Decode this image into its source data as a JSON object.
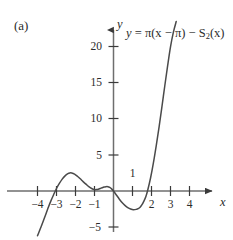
{
  "figure": {
    "panel_label": "(a)",
    "equation_prefix": "y",
    "equation_eq": "=",
    "equation_body": "π(x − π) − S",
    "equation_sub": "2",
    "equation_tail": "(x)",
    "equation_full": "y = π(x − π) − S₂(x)",
    "ink_color": "#3a3a3a",
    "curve_color": "#4a4a4a",
    "background": "#ffffff"
  },
  "chart_data": {
    "type": "line",
    "panel": "(a)",
    "xlabel": "x",
    "ylabel": "y",
    "xlim": [
      -4.8,
      4.8
    ],
    "ylim": [
      -6.5,
      22.5
    ],
    "xticks": [
      -4,
      -3,
      -2,
      -1,
      1,
      2,
      3,
      4
    ],
    "xtick_labels": [
      "−4",
      "−3",
      "−2",
      "−1",
      "1",
      "2",
      "3",
      "4"
    ],
    "xtick_label_above_axis": [
      false,
      false,
      false,
      false,
      true,
      false,
      false,
      false
    ],
    "yticks": [
      -5,
      5,
      10,
      15,
      20
    ],
    "ytick_labels": [
      "−5",
      "5",
      "10",
      "15",
      "20"
    ],
    "grid": false,
    "legend": false,
    "axis_style": "arrows",
    "series": [
      {
        "name": "y = π(x − π) − S₂(x)",
        "x": [
          -4.0,
          -3.8,
          -3.6,
          -3.45,
          -3.3,
          -3.15,
          -3.0,
          -2.85,
          -2.7,
          -2.55,
          -2.4,
          -2.3,
          -2.2,
          -2.05,
          -1.9,
          -1.75,
          -1.6,
          -1.45,
          -1.3,
          -1.15,
          -1.0,
          -0.9,
          -0.8,
          -0.7,
          -0.6,
          -0.5,
          -0.4,
          -0.3,
          -0.2,
          -0.1,
          0.0,
          0.15,
          0.3,
          0.45,
          0.6,
          0.75,
          0.9,
          1.05,
          1.2,
          1.3,
          1.4,
          1.5,
          1.6,
          1.7,
          1.8,
          1.95,
          2.1,
          2.25,
          2.4,
          2.55,
          2.7,
          2.85,
          3.0,
          3.15,
          3.3
        ],
        "y": [
          -6.2,
          -4.9,
          -3.5,
          -2.4,
          -1.4,
          -0.5,
          0.35,
          1.05,
          1.65,
          2.1,
          2.4,
          2.5,
          2.5,
          2.35,
          2.05,
          1.7,
          1.3,
          0.95,
          0.6,
          0.35,
          0.2,
          0.2,
          0.25,
          0.35,
          0.45,
          0.55,
          0.6,
          0.6,
          0.5,
          0.3,
          0.0,
          -0.55,
          -1.1,
          -1.6,
          -2.0,
          -2.3,
          -2.5,
          -2.6,
          -2.55,
          -2.45,
          -2.25,
          -1.9,
          -1.4,
          -0.8,
          0.1,
          1.8,
          3.9,
          6.3,
          8.9,
          11.7,
          14.6,
          17.4,
          20.0,
          22.0,
          23.5
        ]
      }
    ],
    "annotations": [
      {
        "text": "y = π(x − π) − S₂(x)",
        "x": 0.7,
        "y": 21.0,
        "name": "curve-equation-annotation"
      }
    ]
  }
}
